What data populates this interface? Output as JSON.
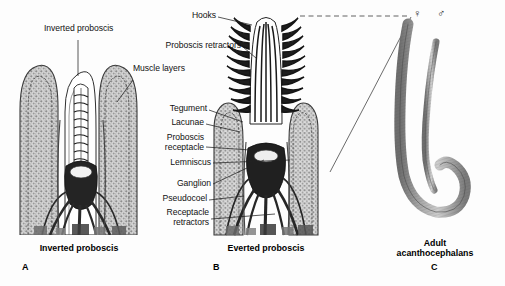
{
  "figure": {
    "background_color": "#fdfdfd",
    "ink_color": "#111111"
  },
  "labels": {
    "inverted_proboscis": "Inverted proboscis",
    "muscle_layers": "Muscle layers",
    "hooks": "Hooks",
    "proboscis_retractors": "Proboscis retractors",
    "tegument": "Tegument",
    "lacunae": "Lacunae",
    "proboscis_receptacle_line1": "Proboscis",
    "proboscis_receptacle_line2": "receptacle",
    "lemniscus": "Lemniscus",
    "ganglion": "Ganglion",
    "pseudocoel": "Pseudocoel",
    "receptacle_retractors_line1": "Receptacle",
    "receptacle_retractors_line2": "retractors"
  },
  "panels": [
    {
      "letter": "A",
      "caption": "Inverted proboscis",
      "caption_lines": [
        "Inverted proboscis"
      ]
    },
    {
      "letter": "B",
      "caption": "Everted proboscis",
      "caption_lines": [
        "Everted proboscis"
      ]
    },
    {
      "letter": "C",
      "caption": "Adult acanthocephalans",
      "caption_lines": [
        "Adult",
        "acanthocephalans"
      ]
    }
  ],
  "symbols": {
    "female": "♀",
    "male": "♂"
  }
}
